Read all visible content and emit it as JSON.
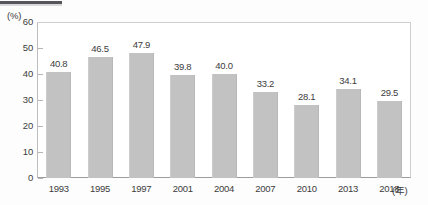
{
  "header": {
    "title_rule_present": true
  },
  "chart_data": {
    "type": "bar",
    "title": "",
    "subtitle": "",
    "xlabel": "(年)",
    "ylabel": "(%)",
    "unit_label": "(%)",
    "x_unit_label": "(年)",
    "categories": [
      "1993",
      "1995",
      "1997",
      "2001",
      "2004",
      "2007",
      "2010",
      "2013",
      "2018"
    ],
    "values": [
      40.8,
      46.5,
      47.9,
      39.8,
      40.0,
      33.2,
      28.1,
      34.1,
      29.5
    ],
    "value_labels": [
      "40.8",
      "46.5",
      "47.9",
      "39.8",
      "40.0",
      "33.2",
      "28.1",
      "34.1",
      "29.5"
    ],
    "ylim": [
      0,
      60
    ],
    "ytick_labels": [
      "60",
      "50",
      "40",
      "30",
      "20",
      "10",
      "0"
    ],
    "ytick_values": [
      60,
      50,
      40,
      30,
      20,
      10,
      0
    ],
    "grid": false,
    "legend": null,
    "bar_color": "#c2c2c2",
    "axis_color": "#9d9d9d",
    "text_color": "#3c3c3c"
  }
}
